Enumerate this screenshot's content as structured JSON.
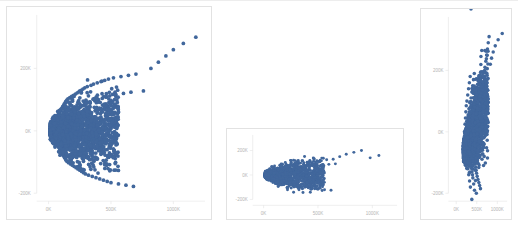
{
  "page": {
    "background_color": "#ffffff",
    "marker_color": "#41679c",
    "panel_border_color": "#e2e2e2",
    "axis_color": "#e4e4e4",
    "axis_text_color": "#b4b4b4",
    "bottom_caption_clipped": " "
  },
  "charts": [
    {
      "name": "scatter-panel-1",
      "axis": {
        "y_ticks": [
          "200K",
          "0K",
          "-200K"
        ],
        "x_ticks": [
          "0K",
          "500K",
          "1000K"
        ]
      }
    },
    {
      "name": "scatter-panel-2",
      "axis": {
        "y_ticks": [
          "200K",
          "0K",
          "-200K"
        ],
        "x_ticks": [
          "0K",
          "500K",
          "1000K"
        ]
      }
    },
    {
      "name": "scatter-panel-3",
      "axis": {
        "y_ticks": [
          "200K",
          "0K",
          "-200K"
        ],
        "x_ticks": [
          "0K",
          "500K",
          "1000K"
        ]
      }
    }
  ],
  "chart_data": [
    {
      "type": "scatter",
      "title": "",
      "xlabel": "",
      "ylabel": "",
      "xlim": [
        -120000,
        1420000
      ],
      "ylim": [
        -320000,
        330000
      ],
      "xticks": [
        0,
        500000,
        1000000
      ],
      "xticklabels": [
        "0K",
        "500K",
        "1000K"
      ],
      "yticks": [
        200000,
        0,
        -200000
      ],
      "yticklabels": [
        "200K",
        "0K",
        "-200K"
      ],
      "grid": false,
      "legend": "none",
      "marker_color": "#41679c",
      "series": [
        {
          "name": "observations",
          "x": [
            20000,
            25000,
            28000,
            30000,
            32000,
            35000,
            36000,
            38000,
            40000,
            42000,
            44000,
            45000,
            46000,
            48000,
            50000,
            52000,
            54000,
            55000,
            56000,
            58000,
            60000,
            62000,
            64000,
            65000,
            66000,
            68000,
            70000,
            72000,
            74000,
            75000,
            76000,
            78000,
            80000,
            82000,
            84000,
            85000,
            86000,
            88000,
            90000,
            92000,
            94000,
            95000,
            96000,
            98000,
            100000,
            102000,
            104000,
            106000,
            108000,
            110000,
            112000,
            114000,
            116000,
            118000,
            120000,
            122000,
            124000,
            126000,
            128000,
            130000,
            132000,
            134000,
            136000,
            138000,
            140000,
            142000,
            144000,
            146000,
            148000,
            150000,
            155000,
            160000,
            165000,
            170000,
            175000,
            180000,
            185000,
            190000,
            195000,
            200000,
            205000,
            210000,
            215000,
            220000,
            225000,
            230000,
            235000,
            240000,
            245000,
            250000,
            255000,
            260000,
            265000,
            270000,
            275000,
            280000,
            285000,
            290000,
            295000,
            300000,
            310000,
            320000,
            330000,
            340000,
            350000,
            360000,
            370000,
            380000,
            390000,
            400000,
            410000,
            420000,
            430000,
            440000,
            450000,
            460000,
            470000,
            480000,
            490000,
            500000,
            520000,
            540000,
            560000,
            580000,
            600000,
            620000,
            640000,
            660000,
            680000,
            700000,
            760000,
            820000,
            880000,
            940000,
            1000000,
            1080000,
            1180000,
            1320000
          ],
          "y": [
            0,
            5000,
            -6000,
            10000,
            -10000,
            14000,
            -14000,
            18000,
            -18000,
            22000,
            -22000,
            8000,
            -8000,
            26000,
            -26000,
            30000,
            -30000,
            12000,
            -12000,
            34000,
            -34000,
            38000,
            -38000,
            16000,
            -16000,
            42000,
            -42000,
            46000,
            -46000,
            20000,
            -20000,
            50000,
            -50000,
            54000,
            -54000,
            24000,
            -24000,
            58000,
            -58000,
            62000,
            -62000,
            28000,
            -28000,
            66000,
            -66000,
            70000,
            -70000,
            32000,
            -32000,
            74000,
            -74000,
            78000,
            -78000,
            36000,
            -36000,
            82000,
            -82000,
            86000,
            -86000,
            40000,
            -40000,
            90000,
            -90000,
            94000,
            -94000,
            44000,
            -44000,
            98000,
            -98000,
            48000,
            102000,
            -102000,
            52000,
            106000,
            -106000,
            56000,
            110000,
            -110000,
            60000,
            114000,
            -114000,
            64000,
            118000,
            -118000,
            68000,
            122000,
            -122000,
            72000,
            126000,
            -126000,
            76000,
            130000,
            -130000,
            80000,
            134000,
            -134000,
            84000,
            138000,
            -138000,
            88000,
            142000,
            -142000,
            92000,
            146000,
            -146000,
            150000,
            96000,
            -150000,
            154000,
            100000,
            -154000,
            158000,
            104000,
            -158000,
            162000,
            108000,
            -162000,
            166000,
            112000,
            -166000,
            170000,
            116000,
            -170000,
            174000,
            120000,
            -174000,
            178000,
            124000,
            -178000,
            182000,
            128000,
            200000,
            220000,
            240000,
            260000,
            280000,
            300000,
            190000,
            210000,
            320000
          ]
        }
      ]
    },
    {
      "type": "scatter",
      "title": "",
      "xlabel": "",
      "ylabel": "",
      "xlim": [
        -120000,
        1420000
      ],
      "ylim": [
        -320000,
        330000
      ],
      "xticks": [
        0,
        500000,
        1000000
      ],
      "xticklabels": [
        "0K",
        "500K",
        "1000K"
      ],
      "yticks": [
        200000,
        0,
        -200000
      ],
      "yticklabels": [
        "200K",
        "0K",
        "-200K"
      ],
      "grid": false,
      "legend": "none",
      "marker_color": "#41679c",
      "series": [
        {
          "name": "observations",
          "x": [
            20000,
            24000,
            28000,
            32000,
            36000,
            40000,
            44000,
            48000,
            52000,
            56000,
            60000,
            64000,
            68000,
            72000,
            76000,
            80000,
            84000,
            88000,
            92000,
            96000,
            100000,
            104000,
            108000,
            112000,
            116000,
            120000,
            124000,
            128000,
            132000,
            136000,
            140000,
            144000,
            148000,
            152000,
            156000,
            160000,
            164000,
            168000,
            172000,
            176000,
            180000,
            184000,
            188000,
            192000,
            196000,
            200000,
            206000,
            212000,
            218000,
            224000,
            230000,
            236000,
            242000,
            248000,
            254000,
            260000,
            266000,
            272000,
            278000,
            284000,
            290000,
            296000,
            302000,
            308000,
            314000,
            320000,
            330000,
            340000,
            350000,
            360000,
            370000,
            380000,
            390000,
            400000,
            410000,
            420000,
            430000,
            440000,
            450000,
            460000,
            470000,
            480000,
            490000,
            500000,
            520000,
            540000,
            560000,
            580000,
            600000,
            620000,
            640000,
            660000,
            700000,
            760000,
            830000,
            900000,
            980000,
            1060000,
            1340000
          ],
          "y": [
            0,
            4000,
            -5000,
            9000,
            -9000,
            13000,
            -13000,
            17000,
            -17000,
            7000,
            -7000,
            21000,
            -21000,
            25000,
            -25000,
            11000,
            -11000,
            29000,
            -29000,
            33000,
            -33000,
            15000,
            -15000,
            37000,
            -37000,
            41000,
            -41000,
            19000,
            -19000,
            45000,
            -45000,
            49000,
            -49000,
            23000,
            -23000,
            53000,
            -53000,
            57000,
            -57000,
            27000,
            -27000,
            61000,
            -61000,
            65000,
            -65000,
            31000,
            69000,
            -69000,
            35000,
            73000,
            -73000,
            39000,
            77000,
            -77000,
            43000,
            81000,
            -81000,
            47000,
            85000,
            -85000,
            51000,
            89000,
            -89000,
            55000,
            93000,
            -93000,
            59000,
            97000,
            -97000,
            63000,
            101000,
            -101000,
            67000,
            105000,
            -105000,
            71000,
            109000,
            -109000,
            75000,
            113000,
            -113000,
            79000,
            117000,
            -117000,
            121000,
            83000,
            -121000,
            125000,
            87000,
            -125000,
            129000,
            91000,
            150000,
            170000,
            185000,
            200000,
            140000,
            160000,
            215000
          ]
        }
      ]
    },
    {
      "type": "scatter",
      "title": "",
      "xlabel": "",
      "ylabel": "",
      "xlim": [
        -120000,
        1420000
      ],
      "ylim": [
        -320000,
        330000
      ],
      "xticks": [
        0,
        500000,
        1000000
      ],
      "xticklabels": [
        "0K",
        "500K",
        "1000K"
      ],
      "yticks": [
        200000,
        0,
        -200000
      ],
      "yticklabels": [
        "200K",
        "0K",
        "-200K"
      ],
      "grid": false,
      "legend": "none",
      "marker_color": "#41679c",
      "series": [
        {
          "name": "observations",
          "x": [
            200000,
            210000,
            215000,
            220000,
            225000,
            230000,
            235000,
            240000,
            245000,
            250000,
            255000,
            260000,
            265000,
            270000,
            275000,
            280000,
            285000,
            290000,
            295000,
            300000,
            305000,
            310000,
            315000,
            320000,
            325000,
            330000,
            335000,
            340000,
            345000,
            350000,
            355000,
            360000,
            365000,
            370000,
            375000,
            380000,
            385000,
            390000,
            395000,
            400000,
            405000,
            410000,
            415000,
            420000,
            425000,
            430000,
            435000,
            440000,
            445000,
            450000,
            455000,
            460000,
            465000,
            470000,
            475000,
            480000,
            485000,
            490000,
            495000,
            500000,
            510000,
            520000,
            530000,
            540000,
            550000,
            560000,
            570000,
            580000,
            590000,
            600000,
            610000,
            620000,
            630000,
            640000,
            650000,
            660000,
            670000,
            680000,
            690000,
            700000,
            720000,
            740000,
            760000,
            780000,
            800000,
            830000,
            860000,
            900000,
            950000,
            1020000,
            1120000,
            1300000,
            430000,
            450000,
            470000,
            490000,
            380000,
            400000,
            360000
          ],
          "y": [
            0,
            -20000,
            25000,
            -40000,
            45000,
            -60000,
            65000,
            -80000,
            85000,
            15000,
            -15000,
            100000,
            -100000,
            35000,
            -35000,
            120000,
            -120000,
            55000,
            -55000,
            140000,
            -140000,
            75000,
            -75000,
            160000,
            -160000,
            95000,
            -95000,
            180000,
            -180000,
            10000,
            -10000,
            110000,
            -110000,
            30000,
            -30000,
            130000,
            -130000,
            50000,
            -50000,
            150000,
            -150000,
            70000,
            -70000,
            170000,
            -170000,
            90000,
            -90000,
            190000,
            -190000,
            5000,
            -5000,
            105000,
            -105000,
            115000,
            -115000,
            125000,
            -125000,
            135000,
            -135000,
            145000,
            -145000,
            155000,
            -155000,
            165000,
            -165000,
            175000,
            -175000,
            185000,
            -185000,
            195000,
            20000,
            -20000,
            60000,
            -60000,
            40000,
            -40000,
            80000,
            -80000,
            200000,
            210000,
            230000,
            250000,
            270000,
            290000,
            310000,
            220000,
            240000,
            260000,
            280000,
            300000,
            320000,
            -210000,
            -230000,
            -250000,
            -270000,
            -200000,
            -220000,
            -240000
          ]
        }
      ]
    }
  ]
}
